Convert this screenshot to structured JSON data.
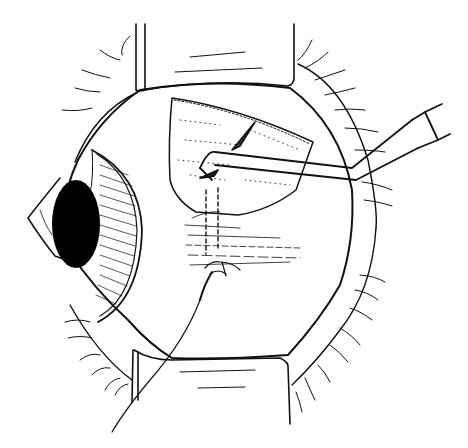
{
  "figure": {
    "alt": "Line illustration of an eye surgery: eyeball viewed from the side with retractors holding lids open, a scleral flap incision, a bent cannula instrument entering from the right, and a suture below the flap.",
    "colors": {
      "ink": "#111111",
      "background": "#ffffff",
      "pupil": "#000000"
    },
    "elements": [
      "eyeball",
      "cornea",
      "iris",
      "pupil",
      "upper-retractor",
      "lower-retractor",
      "eyelashes",
      "scleral-flap",
      "cannula-instrument",
      "suture-needle",
      "suture-thread"
    ]
  }
}
